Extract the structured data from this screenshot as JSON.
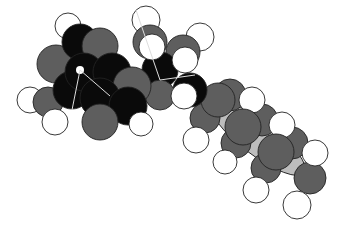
{
  "image": {
    "subject": "space-filling molecular model",
    "colors": {
      "black_atom": "#0a0a0a",
      "dark_gray_atom": "#5e5e5e",
      "light_gray_atom": "#bdbdbd",
      "white_atom": "#ffffff",
      "outline": "#222222",
      "background": "#ffffff"
    },
    "atoms": [
      {
        "el": "H",
        "cx": 68,
        "cy": 25,
        "r": 13
      },
      {
        "el": "O",
        "cx": 78,
        "cy": 42,
        "r": 18
      },
      {
        "el": "C",
        "cx": 100,
        "cy": 45,
        "r": 18
      },
      {
        "el": "C",
        "cx": 55,
        "cy": 62,
        "r": 19
      },
      {
        "el": "N",
        "cx": 82,
        "cy": 74,
        "r": 20
      },
      {
        "el": "N",
        "cx": 110,
        "cy": 73,
        "r": 20
      },
      {
        "el": "C",
        "cx": 130,
        "cy": 85,
        "r": 19
      },
      {
        "el": "C",
        "cx": 70,
        "cy": 90,
        "r": 19
      },
      {
        "el": "O",
        "cx": 98,
        "cy": 100,
        "r": 20
      },
      {
        "el": "N",
        "cx": 128,
        "cy": 108,
        "r": 19
      },
      {
        "el": "C",
        "cx": 98,
        "cy": 120,
        "r": 18
      },
      {
        "el": "C",
        "cx": 45,
        "cy": 103,
        "r": 15
      },
      {
        "el": "H",
        "cx": 30,
        "cy": 100,
        "r": 13
      },
      {
        "el": "H",
        "cx": 55,
        "cy": 120,
        "r": 13
      },
      {
        "el": "H",
        "cx": 140,
        "cy": 123,
        "r": 12
      },
      {
        "el": "H",
        "cx": 146,
        "cy": 18,
        "r": 14
      },
      {
        "el": "C",
        "cx": 150,
        "cy": 45,
        "r": 17
      },
      {
        "el": "H",
        "cx": 150,
        "cy": 48,
        "r": 13
      },
      {
        "el": "H",
        "cx": 200,
        "cy": 37,
        "r": 14
      },
      {
        "el": "C",
        "cx": 185,
        "cy": 55,
        "r": 17
      },
      {
        "el": "H",
        "cx": 186,
        "cy": 60,
        "r": 13
      },
      {
        "el": "C",
        "cx": 165,
        "cy": 92,
        "r": 15
      },
      {
        "el": "C",
        "cx": 185,
        "cy": 102,
        "r": 17
      },
      {
        "el": "H",
        "cx": 185,
        "cy": 98,
        "r": 13
      },
      {
        "el": "C",
        "cx": 215,
        "cy": 100,
        "r": 17
      },
      {
        "el": "H",
        "cx": 250,
        "cy": 100,
        "r": 13
      },
      {
        "el": "C",
        "cx": 240,
        "cy": 120,
        "r": 17
      },
      {
        "el": "H",
        "cx": 195,
        "cy": 140,
        "r": 13
      },
      {
        "el": "C",
        "cx": 260,
        "cy": 135,
        "r": 17
      },
      {
        "el": "H",
        "cx": 280,
        "cy": 125,
        "r": 13
      },
      {
        "el": "C",
        "cx": 245,
        "cy": 160,
        "r": 16
      },
      {
        "el": "H",
        "cx": 225,
        "cy": 165,
        "r": 12
      },
      {
        "el": "C",
        "cx": 285,
        "cy": 160,
        "r": 17
      },
      {
        "el": "H",
        "cx": 315,
        "cy": 153,
        "r": 13
      },
      {
        "el": "C",
        "cx": 295,
        "cy": 180,
        "r": 16
      },
      {
        "el": "H",
        "cx": 255,
        "cy": 190,
        "r": 12
      },
      {
        "el": "H",
        "cx": 295,
        "cy": 205,
        "r": 14
      },
      {
        "el": "C",
        "cx": 310,
        "cy": 185,
        "r": 15
      }
    ]
  }
}
